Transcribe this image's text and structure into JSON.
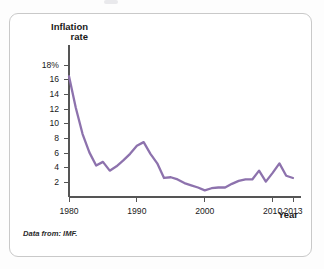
{
  "figure": {
    "source_note": "Data from: IMF.",
    "line_color": "#8d72ad",
    "axis_color": "#555555",
    "border_color": "#c9c9c9"
  },
  "chart_data": {
    "type": "line",
    "title": "",
    "subtitle": "",
    "ylabel_line1": "Inflation",
    "ylabel_line2": "rate",
    "xlabel": "Year",
    "grid": false,
    "legend": "none",
    "xlim": [
      1980,
      2013
    ],
    "ylim": [
      0,
      19
    ],
    "yticks": [
      2,
      4,
      6,
      8,
      10,
      12,
      14,
      16,
      18
    ],
    "ytick_labels": [
      "2",
      "4",
      "6",
      "8",
      "10",
      "12",
      "14",
      "16",
      "18%"
    ],
    "xticks": [
      1980,
      1990,
      2000,
      2010,
      2013
    ],
    "xtick_labels": [
      "1980",
      "1990",
      "2000",
      "2010",
      "2013"
    ],
    "series": [
      {
        "name": "Inflation rate",
        "color": "#8d72ad",
        "x": [
          1980,
          1981,
          1982,
          1983,
          1984,
          1985,
          1986,
          1987,
          1988,
          1989,
          1990,
          1991,
          1992,
          1993,
          1994,
          1995,
          1996,
          1997,
          1998,
          1999,
          2000,
          2001,
          2002,
          2003,
          2004,
          2005,
          2006,
          2007,
          2008,
          2009,
          2010,
          2011,
          2012,
          2013
        ],
        "values": [
          16.5,
          12.2,
          8.6,
          6.1,
          4.3,
          4.8,
          3.6,
          4.2,
          5.0,
          5.9,
          7.0,
          7.5,
          5.9,
          4.6,
          2.6,
          2.7,
          2.4,
          1.9,
          1.6,
          1.3,
          0.9,
          1.2,
          1.3,
          1.3,
          1.8,
          2.2,
          2.4,
          2.4,
          3.6,
          2.1,
          3.3,
          4.6,
          2.9,
          2.6
        ]
      }
    ]
  }
}
